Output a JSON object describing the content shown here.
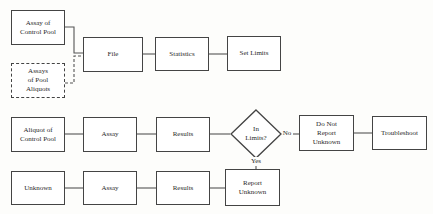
{
  "diagram": {
    "type": "flowchart",
    "row1": {
      "assay_control_pool": "Assay of\nControl Pool",
      "assays_pool_aliquots": "Assays\nof Pool\nAliquots",
      "file": "File",
      "statistics": "Statistics",
      "set_limits": "Set Limits"
    },
    "row2": {
      "aliquot_control_pool": "Aliquot of\nControl Pool",
      "assay": "Assay",
      "results": "Results",
      "decision": "In\nLimits?",
      "no_label": "No",
      "yes_label": "Yes",
      "do_not_report": "Do Not\nReport\nUnknown",
      "troubleshoot": "Troubleshoot"
    },
    "row3": {
      "unknown": "Unknown",
      "assay": "Assay",
      "results": "Results",
      "report_unknown": "Report\nUnknown"
    }
  }
}
